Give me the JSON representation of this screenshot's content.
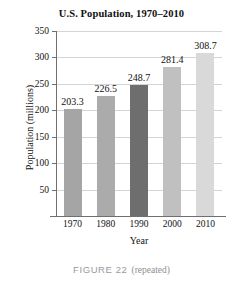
{
  "chart_data": {
    "type": "bar",
    "title": "U.S. Population, 1970–2010",
    "xlabel": "Year",
    "ylabel": "Population (millions)",
    "categories": [
      "1970",
      "1980",
      "1990",
      "2000",
      "2010"
    ],
    "values": [
      203.3,
      226.5,
      248.7,
      281.4,
      308.7
    ],
    "value_labels": [
      "203.3",
      "226.5",
      "248.7",
      "281.4",
      "308.7"
    ],
    "bar_colors": [
      "#a5a5a5",
      "#ababab",
      "#6e6e6e",
      "#c0c0c0",
      "#d9d9d9"
    ],
    "ylim": [
      0,
      350
    ],
    "yticks": [
      50,
      100,
      150,
      200,
      250,
      300,
      350
    ],
    "ytick_labels": [
      "50",
      "100",
      "150",
      "200",
      "250",
      "300",
      "350"
    ],
    "grid": true,
    "grid_color": "#d4d4d4",
    "axis_color": "#6f6f6f",
    "legend": null
  },
  "caption": {
    "label": "FIGURE 22",
    "note": "(repeated)",
    "color": "#9a9a9a"
  }
}
